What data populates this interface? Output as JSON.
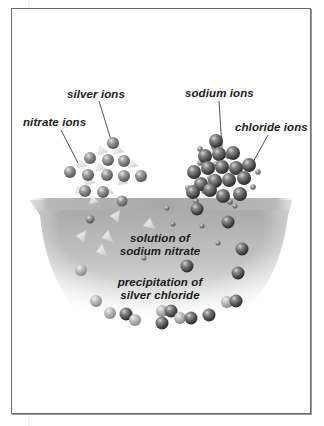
{
  "diagram": {
    "title": "Precipitation of silver chloride",
    "labels": {
      "silver_ions": "silver ions",
      "nitrate_ions": "nitrate ions",
      "sodium_ions": "sodium ions",
      "chloride_ions": "chloride ions",
      "solution_line1": "solution of",
      "solution_line2": "sodium nitrate",
      "precip_line1": "precipitation of",
      "precip_line2": "silver chloride"
    },
    "components": [
      {
        "id": "silver-nitrate-crystal",
        "ions": [
          "silver ions",
          "nitrate ions"
        ]
      },
      {
        "id": "sodium-chloride-crystal",
        "ions": [
          "sodium ions",
          "chloride ions"
        ]
      },
      {
        "id": "solution",
        "content": "solution of sodium nitrate"
      },
      {
        "id": "precipitate",
        "content": "precipitation of silver chloride"
      }
    ],
    "colors": {
      "frame": "#6b6b6b",
      "solution_gray": "#9e9e9e",
      "ion_dark": "#4a4a4a",
      "ion_light": "#dcdcdc",
      "label_text": "#1a1a1a"
    }
  }
}
